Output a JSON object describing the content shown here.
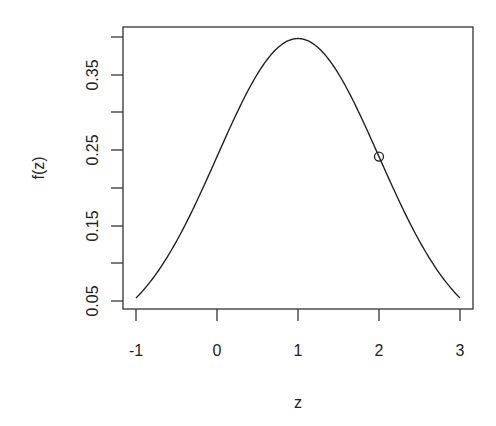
{
  "chart_data": {
    "type": "line",
    "title": "",
    "xlabel": "z",
    "ylabel": "f(z)",
    "xlim": [
      -1,
      3
    ],
    "ylim": [
      0.05,
      0.4
    ],
    "x_ticks": [
      "-1",
      "0",
      "1",
      "2",
      "3"
    ],
    "y_ticks": [
      "0.05",
      "0.15",
      "0.25",
      "0.35"
    ],
    "y_minor_ticks": [
      0.1,
      0.2,
      0.3,
      0.4
    ],
    "grid": false,
    "legend": null,
    "series": [
      {
        "name": "normal density (mean 1, sd 1)",
        "x": [
          -1.0,
          -0.5,
          0.0,
          0.5,
          1.0,
          1.5,
          2.0,
          2.5,
          3.0
        ],
        "values": [
          0.054,
          0.13,
          0.242,
          0.352,
          0.399,
          0.352,
          0.242,
          0.13,
          0.054
        ]
      }
    ],
    "annotations": [
      {
        "type": "open-circle-point",
        "x": 2,
        "y": 0.242
      }
    ]
  },
  "axes": {
    "x_title": "z",
    "y_title": "f(z)",
    "x_tick_labels": [
      "-1",
      "0",
      "1",
      "2",
      "3"
    ],
    "y_tick_labels": [
      "0.05",
      "0.15",
      "0.25",
      "0.35"
    ]
  }
}
